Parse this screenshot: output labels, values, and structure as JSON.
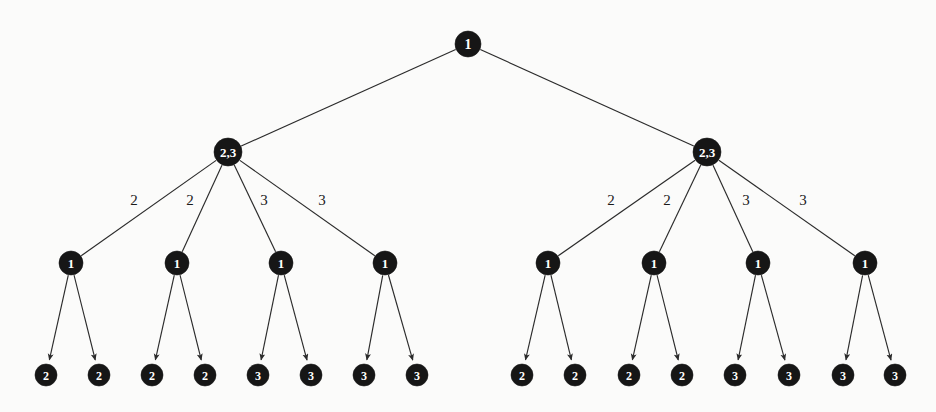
{
  "figure": {
    "type": "tree-diagram",
    "width": 936,
    "height": 412,
    "background_color": "#fbfbfa",
    "node_fill_color": "#161616",
    "node_text_color": "#ffffff",
    "edge_color": "#2b2b2b"
  },
  "nodes": [
    {
      "id": "root",
      "label": "1",
      "x": 468,
      "y": 44,
      "r": 13,
      "font_size": 14,
      "level": 0
    },
    {
      "id": "L",
      "label": "2,3",
      "x": 228,
      "y": 152,
      "r": 14,
      "font_size": 13,
      "level": 1
    },
    {
      "id": "R",
      "label": "2,3",
      "x": 707,
      "y": 152,
      "r": 14,
      "font_size": 13,
      "level": 1
    },
    {
      "id": "L1",
      "label": "1",
      "x": 71,
      "y": 263,
      "r": 12,
      "font_size": 13,
      "level": 2
    },
    {
      "id": "L2",
      "label": "1",
      "x": 177,
      "y": 263,
      "r": 12,
      "font_size": 13,
      "level": 2
    },
    {
      "id": "L3",
      "label": "1",
      "x": 281,
      "y": 263,
      "r": 12,
      "font_size": 13,
      "level": 2
    },
    {
      "id": "L4",
      "label": "1",
      "x": 385,
      "y": 263,
      "r": 12,
      "font_size": 13,
      "level": 2
    },
    {
      "id": "R1",
      "label": "1",
      "x": 548,
      "y": 263,
      "r": 12,
      "font_size": 13,
      "level": 2
    },
    {
      "id": "R2",
      "label": "1",
      "x": 654,
      "y": 263,
      "r": 12,
      "font_size": 13,
      "level": 2
    },
    {
      "id": "R3",
      "label": "1",
      "x": 758,
      "y": 263,
      "r": 12,
      "font_size": 13,
      "level": 2
    },
    {
      "id": "R4",
      "label": "1",
      "x": 865,
      "y": 263,
      "r": 12,
      "font_size": 13,
      "level": 2
    },
    {
      "id": "L1a",
      "label": "2",
      "x": 46,
      "y": 375,
      "r": 11,
      "font_size": 12,
      "level": 3
    },
    {
      "id": "L1b",
      "label": "2",
      "x": 99,
      "y": 375,
      "r": 11,
      "font_size": 12,
      "level": 3
    },
    {
      "id": "L2a",
      "label": "2",
      "x": 152,
      "y": 375,
      "r": 11,
      "font_size": 12,
      "level": 3
    },
    {
      "id": "L2b",
      "label": "2",
      "x": 205,
      "y": 375,
      "r": 11,
      "font_size": 12,
      "level": 3
    },
    {
      "id": "L3a",
      "label": "3",
      "x": 258,
      "y": 375,
      "r": 11,
      "font_size": 12,
      "level": 3
    },
    {
      "id": "L3b",
      "label": "3",
      "x": 311,
      "y": 375,
      "r": 11,
      "font_size": 12,
      "level": 3
    },
    {
      "id": "L4a",
      "label": "3",
      "x": 364,
      "y": 375,
      "r": 11,
      "font_size": 12,
      "level": 3
    },
    {
      "id": "L4b",
      "label": "3",
      "x": 417,
      "y": 375,
      "r": 11,
      "font_size": 12,
      "level": 3
    },
    {
      "id": "R1a",
      "label": "2",
      "x": 522,
      "y": 375,
      "r": 11,
      "font_size": 12,
      "level": 3
    },
    {
      "id": "R1b",
      "label": "2",
      "x": 575,
      "y": 375,
      "r": 11,
      "font_size": 12,
      "level": 3
    },
    {
      "id": "R2a",
      "label": "2",
      "x": 629,
      "y": 375,
      "r": 11,
      "font_size": 12,
      "level": 3
    },
    {
      "id": "R2b",
      "label": "2",
      "x": 682,
      "y": 375,
      "r": 11,
      "font_size": 12,
      "level": 3
    },
    {
      "id": "R3a",
      "label": "3",
      "x": 735,
      "y": 375,
      "r": 11,
      "font_size": 12,
      "level": 3
    },
    {
      "id": "R3b",
      "label": "3",
      "x": 789,
      "y": 375,
      "r": 11,
      "font_size": 12,
      "level": 3
    },
    {
      "id": "R4a",
      "label": "3",
      "x": 843,
      "y": 375,
      "r": 11,
      "font_size": 12,
      "level": 3
    },
    {
      "id": "R4b",
      "label": "3",
      "x": 895,
      "y": 375,
      "r": 11,
      "font_size": 12,
      "level": 3
    }
  ],
  "edges": [
    {
      "from": "root",
      "to": "L",
      "label": "",
      "arrow": false
    },
    {
      "from": "root",
      "to": "R",
      "label": "",
      "arrow": false
    },
    {
      "from": "L",
      "to": "L1",
      "label": "2",
      "label_x": 134,
      "label_y": 200,
      "arrow": false
    },
    {
      "from": "L",
      "to": "L2",
      "label": "2",
      "label_x": 190,
      "label_y": 200,
      "arrow": false
    },
    {
      "from": "L",
      "to": "L3",
      "label": "3",
      "label_x": 264,
      "label_y": 200,
      "arrow": false
    },
    {
      "from": "L",
      "to": "L4",
      "label": "3",
      "label_x": 322,
      "label_y": 200,
      "arrow": false
    },
    {
      "from": "R",
      "to": "R1",
      "label": "2",
      "label_x": 611,
      "label_y": 200,
      "arrow": false
    },
    {
      "from": "R",
      "to": "R2",
      "label": "2",
      "label_x": 667,
      "label_y": 200,
      "arrow": false
    },
    {
      "from": "R",
      "to": "R3",
      "label": "3",
      "label_x": 746,
      "label_y": 200,
      "arrow": false
    },
    {
      "from": "R",
      "to": "R4",
      "label": "3",
      "label_x": 803,
      "label_y": 200,
      "arrow": false
    },
    {
      "from": "L1",
      "to": "L1a",
      "label": "",
      "arrow": true
    },
    {
      "from": "L1",
      "to": "L1b",
      "label": "",
      "arrow": true
    },
    {
      "from": "L2",
      "to": "L2a",
      "label": "",
      "arrow": true
    },
    {
      "from": "L2",
      "to": "L2b",
      "label": "",
      "arrow": true
    },
    {
      "from": "L3",
      "to": "L3a",
      "label": "",
      "arrow": true
    },
    {
      "from": "L3",
      "to": "L3b",
      "label": "",
      "arrow": true
    },
    {
      "from": "L4",
      "to": "L4a",
      "label": "",
      "arrow": true
    },
    {
      "from": "L4",
      "to": "L4b",
      "label": "",
      "arrow": true
    },
    {
      "from": "R1",
      "to": "R1a",
      "label": "",
      "arrow": true
    },
    {
      "from": "R1",
      "to": "R1b",
      "label": "",
      "arrow": true
    },
    {
      "from": "R2",
      "to": "R2a",
      "label": "",
      "arrow": true
    },
    {
      "from": "R2",
      "to": "R2b",
      "label": "",
      "arrow": true
    },
    {
      "from": "R3",
      "to": "R3a",
      "label": "",
      "arrow": true
    },
    {
      "from": "R3",
      "to": "R3b",
      "label": "",
      "arrow": true
    },
    {
      "from": "R4",
      "to": "R4a",
      "label": "",
      "arrow": true
    },
    {
      "from": "R4",
      "to": "R4b",
      "label": "",
      "arrow": true
    }
  ]
}
